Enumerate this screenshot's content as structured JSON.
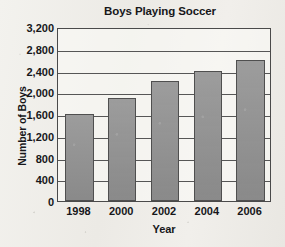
{
  "chart_data": {
    "type": "bar",
    "title": "Boys Playing Soccer",
    "xlabel": "Year",
    "ylabel": "Number of Boys",
    "categories": [
      "1998",
      "2000",
      "2002",
      "2004",
      "2006"
    ],
    "values": [
      1600,
      1900,
      2200,
      2400,
      2600
    ],
    "ylim": [
      0,
      3200
    ],
    "ytick_values": [
      0,
      400,
      800,
      1200,
      1600,
      2000,
      2400,
      2800,
      3200
    ],
    "ytick_labels": [
      "0",
      "400",
      "800",
      "1,200",
      "1,600",
      "2,000",
      "2,400",
      "2,800",
      "3,200"
    ],
    "grid": true,
    "legend": null,
    "series": [
      {
        "name": "Number of Boys",
        "values": [
          1600,
          1900,
          2200,
          2400,
          2600
        ]
      }
    ],
    "colors": {
      "bar_fill": "#919191",
      "bar_border": "#4f4f4f",
      "gridline": "#565656",
      "axis": "#4a4a4a",
      "text": "#17171a",
      "background": "#efeeea"
    }
  }
}
